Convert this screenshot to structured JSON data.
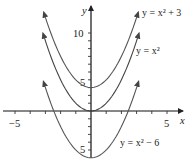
{
  "chart_data": {
    "type": "line",
    "title": "",
    "xlabel": "x",
    "ylabel": "y",
    "xlim": [
      -5.8,
      6.0
    ],
    "ylim": [
      -6.2,
      13.8
    ],
    "grid": false,
    "x_ticks": [
      -5,
      -4,
      -3,
      -2,
      -1,
      1,
      2,
      3,
      4,
      5
    ],
    "x_tick_labels": [
      {
        "value": -5,
        "label": "-5"
      },
      {
        "value": 5,
        "label": "5"
      }
    ],
    "y_ticks": [
      -5,
      -4,
      -3,
      -2,
      -1,
      1,
      2,
      3,
      4,
      5,
      6,
      7,
      8,
      9,
      10
    ],
    "y_tick_labels": [
      {
        "value": 10,
        "label": "10"
      },
      {
        "value": 5,
        "label": "5"
      },
      {
        "value": -5,
        "label": "5"
      }
    ],
    "series": [
      {
        "name": "y = x^2 + 3",
        "label": "y = x² + 3",
        "shift": 3,
        "x_range": [
          -3.1,
          3.1
        ],
        "color": "#555555"
      },
      {
        "name": "y = x^2",
        "label": "y = x²",
        "shift": 0,
        "x_range": [
          -3.15,
          3.15
        ],
        "color": "#444444"
      },
      {
        "name": "y = x^2 - 6",
        "label": "y = x² − 6",
        "shift": -6,
        "x_range": [
          -3.12,
          3.12
        ],
        "color": "#555555"
      }
    ],
    "annotations": [
      {
        "text": "y = x² + 3",
        "near_series": 0
      },
      {
        "text": "y = x²",
        "near_series": 1
      },
      {
        "text": "y = x² − 6",
        "near_series": 2
      }
    ]
  },
  "axes": {
    "x_label": "x",
    "y_label": "y",
    "tick_neg5_x": "−5",
    "tick_5_x": "5",
    "tick_10_y": "10",
    "tick_5_y": "5",
    "tick_neg5_y": "5"
  },
  "labels": {
    "curve_top": "y = x² + 3",
    "curve_mid": "y = x²",
    "curve_bottom": "y = x² − 6"
  }
}
